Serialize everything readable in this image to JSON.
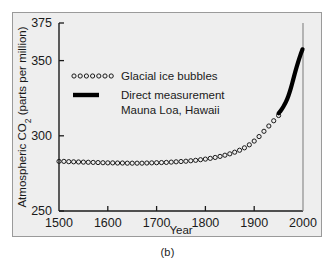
{
  "figure": {
    "caption": "(b)",
    "background_color": "#eeeeee",
    "frame_color": "#9a9a9a"
  },
  "chart_data": {
    "type": "scatter",
    "title": "",
    "xlabel": "Year",
    "ylabel": "Atmospheric CO2 (parts per million)",
    "ylabel_parts": {
      "prefix": "Atmospheric CO",
      "subscript": "2",
      "suffix": " (parts per million)"
    },
    "xlim": [
      1500,
      2000
    ],
    "ylim": [
      250,
      375
    ],
    "xticks": [
      1500,
      1600,
      1700,
      1800,
      1900,
      2000
    ],
    "yticks": [
      250,
      300,
      350,
      375
    ],
    "xtick_labels": [
      "1500",
      "1600",
      "1700",
      "1800",
      "1900",
      "2000"
    ],
    "ytick_labels": [
      "250",
      "300",
      "350",
      "375"
    ],
    "grid": false,
    "legend_position": "upper-left-inside",
    "series": [
      {
        "name": "Glacial ice bubbles",
        "marker": "open-circle",
        "color": "#1a1a1a",
        "x": [
          1500,
          1510,
          1520,
          1530,
          1540,
          1550,
          1560,
          1570,
          1580,
          1590,
          1600,
          1610,
          1620,
          1630,
          1640,
          1650,
          1660,
          1670,
          1680,
          1690,
          1700,
          1710,
          1720,
          1730,
          1740,
          1750,
          1760,
          1770,
          1780,
          1790,
          1800,
          1810,
          1820,
          1830,
          1840,
          1850,
          1860,
          1870,
          1880,
          1890,
          1900,
          1910,
          1920,
          1930,
          1940,
          1950
        ],
        "y": [
          283.0,
          283.0,
          282.8,
          282.7,
          282.6,
          282.5,
          282.4,
          282.3,
          282.2,
          282.1,
          282.0,
          282.0,
          281.9,
          281.9,
          281.8,
          281.8,
          281.8,
          281.8,
          281.9,
          282.0,
          282.1,
          282.2,
          282.3,
          282.5,
          282.7,
          282.9,
          283.1,
          283.4,
          283.7,
          284.1,
          284.5,
          285.0,
          285.6,
          286.3,
          287.1,
          288.0,
          289.1,
          290.4,
          292.0,
          294.0,
          296.5,
          299.5,
          303.0,
          306.5,
          310.0,
          313.5
        ]
      },
      {
        "name": "Direct measurement Mauna Loa, Hawaii",
        "marker": "thick-line",
        "color": "#000000",
        "x": [
          1950,
          1955,
          1960,
          1965,
          1970,
          1975,
          1980,
          1985,
          1990,
          1995,
          1999
        ],
        "y": [
          315.0,
          317.0,
          319.5,
          322.5,
          326.5,
          331.5,
          337.5,
          343.5,
          349.0,
          354.0,
          357.5
        ]
      }
    ],
    "legend": [
      {
        "label": "Glacial ice bubbles",
        "marker": "open-circle-row"
      },
      {
        "label": "Direct measurement",
        "marker": "thick-line"
      },
      {
        "label": "Mauna Loa, Hawaii",
        "marker": "none"
      }
    ]
  }
}
